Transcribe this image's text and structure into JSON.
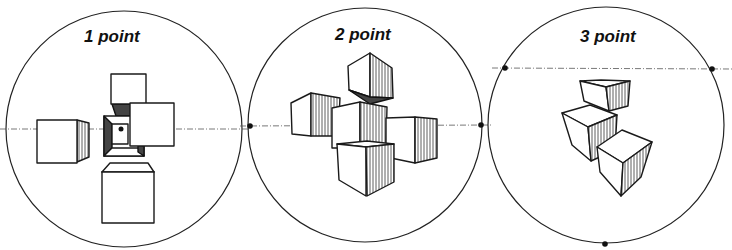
{
  "diagram": {
    "panels": [
      {
        "id": "one-point",
        "label": "1 point",
        "vanishing_points": 1
      },
      {
        "id": "two-point",
        "label": "2 point",
        "vanishing_points": 2
      },
      {
        "id": "three-point",
        "label": "3 point",
        "vanishing_points": 3
      }
    ],
    "colors": {
      "ink": "#1a1a1a",
      "paper": "#ffffff",
      "horizon": "#555555"
    }
  }
}
